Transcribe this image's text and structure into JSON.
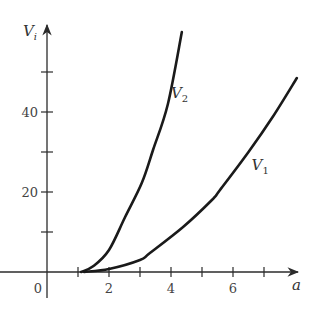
{
  "chart_data": {
    "type": "line",
    "title": "",
    "xlabel": "a",
    "ylabel": "V_i",
    "ylabel_main": "V",
    "ylabel_sub": "i",
    "xlim": [
      -0.5,
      8.2
    ],
    "ylim": [
      -6,
      62
    ],
    "grid": false,
    "legend": "inline labels on curves",
    "x_ticks": [
      1,
      2,
      3,
      4,
      5,
      6,
      7
    ],
    "x_tick_labels": {
      "0": "0",
      "2": "2",
      "4": "4",
      "6": "6"
    },
    "y_ticks": [
      10,
      20,
      30,
      40,
      50
    ],
    "y_tick_labels": {
      "20": "20",
      "40": "40"
    },
    "series": [
      {
        "name": "V2",
        "label_main": "V",
        "label_sub": "2",
        "label_pos": [
          4.0,
          43.5
        ],
        "points": [
          [
            1.1,
            0
          ],
          [
            1.5,
            1.5
          ],
          [
            2.0,
            5.5
          ],
          [
            2.52,
            13.75
          ],
          [
            3.06,
            22.3
          ],
          [
            3.42,
            30.5
          ],
          [
            3.9,
            42
          ],
          [
            4.35,
            60
          ]
        ]
      },
      {
        "name": "V1",
        "label_main": "V",
        "label_sub": "1",
        "label_pos": [
          6.6,
          25.5
        ],
        "points": [
          [
            1.2,
            0
          ],
          [
            2.0,
            0.75
          ],
          [
            3.0,
            3
          ],
          [
            3.32,
            4.75
          ],
          [
            4.39,
            11.25
          ],
          [
            5.32,
            18
          ],
          [
            5.58,
            20.5
          ],
          [
            6.5,
            30
          ],
          [
            7.3,
            39
          ],
          [
            8.06,
            48.5
          ]
        ]
      }
    ]
  },
  "axes": {
    "x_label": "a",
    "y_label": "V",
    "y_label_sub": "i",
    "origin_label": "0"
  }
}
